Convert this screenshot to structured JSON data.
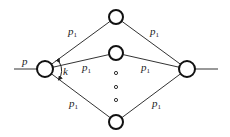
{
  "diagram": {
    "title": "",
    "input_label": "p",
    "angle_label": "k",
    "edge_label_base": "p",
    "edge_label_sub": "1",
    "nodes": {
      "source": {
        "x": 45,
        "y": 69,
        "r": 8
      },
      "sink": {
        "x": 187,
        "y": 69,
        "r": 8
      },
      "middle": [
        {
          "x": 116,
          "y": 17,
          "r": 7
        },
        {
          "x": 116,
          "y": 53,
          "r": 7
        },
        {
          "x": 116,
          "y": 122,
          "r": 7
        }
      ]
    },
    "ellipsis_dots": [
      {
        "x": 116,
        "y": 73
      },
      {
        "x": 116,
        "y": 87
      },
      {
        "x": 116,
        "y": 100
      }
    ],
    "edge_labels": [
      {
        "x": 68,
        "y": 35,
        "base": "p",
        "sub": "1"
      },
      {
        "x": 82,
        "y": 71,
        "base": "p",
        "sub": "1"
      },
      {
        "x": 69,
        "y": 107,
        "base": "p",
        "sub": "1"
      },
      {
        "x": 150,
        "y": 35,
        "base": "p",
        "sub": "1"
      },
      {
        "x": 141,
        "y": 71,
        "base": "p",
        "sub": "1"
      },
      {
        "x": 152,
        "y": 107,
        "base": "p",
        "sub": "1"
      }
    ],
    "input_line": {
      "x1": 14,
      "x2": 37,
      "y": 69
    },
    "output_line": {
      "x1": 195,
      "x2": 218,
      "y": 69
    },
    "colors": {
      "stroke": "#111111",
      "edge": "#333333",
      "background": "#ffffff"
    }
  }
}
